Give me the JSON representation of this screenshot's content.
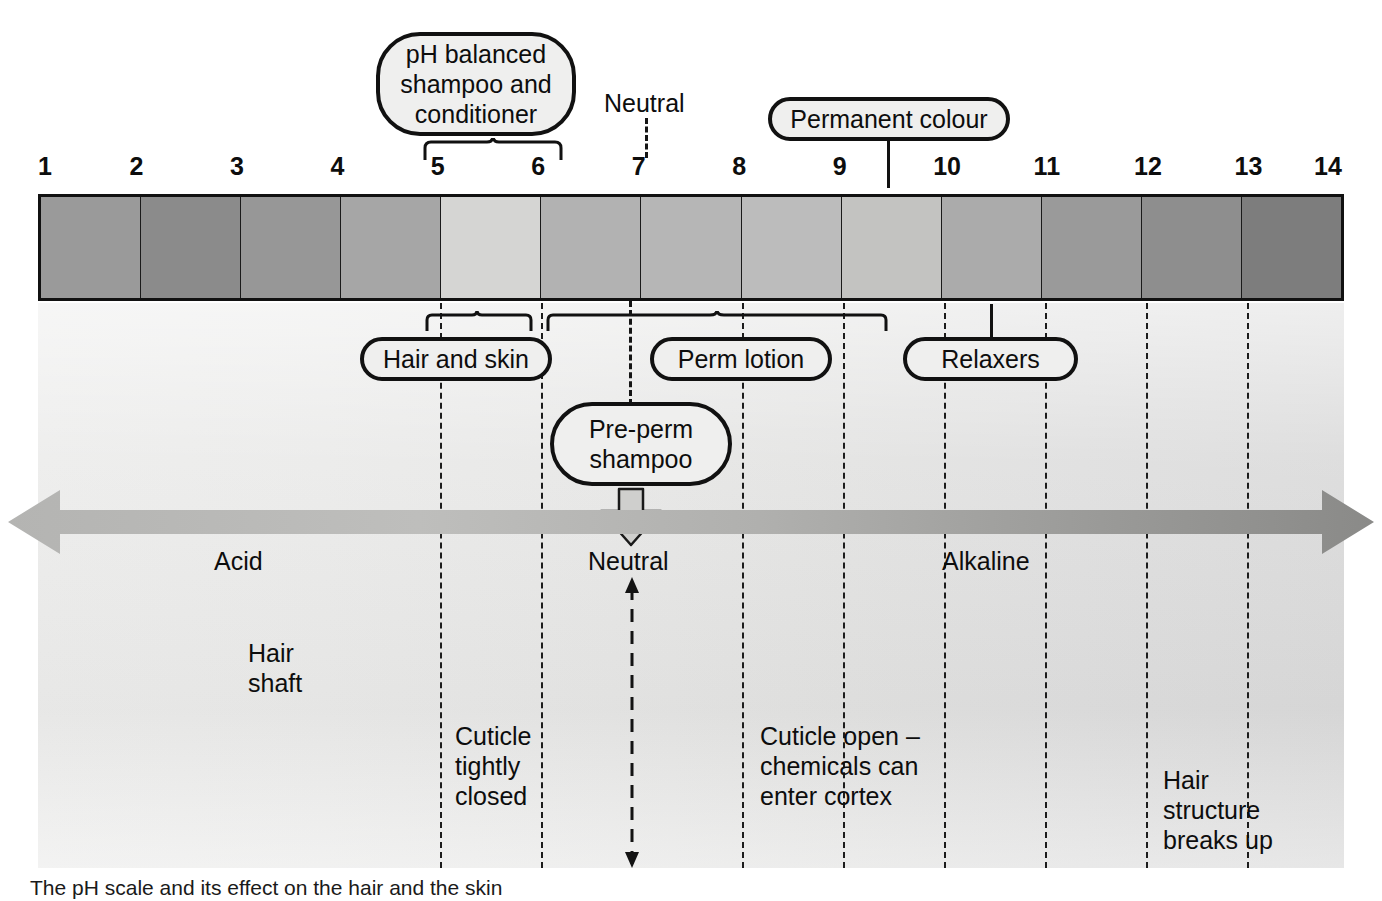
{
  "diagram": {
    "scale": {
      "ticks": [
        "1",
        "2",
        "3",
        "4",
        "5",
        "6",
        "7",
        "8",
        "9",
        "10",
        "11",
        "12",
        "13",
        "14"
      ],
      "bands": [
        {
          "ph": "1-2",
          "color": "#9a9a9a"
        },
        {
          "ph": "2-3",
          "color": "#8b8b8b"
        },
        {
          "ph": "3-4",
          "color": "#979797"
        },
        {
          "ph": "4-5",
          "color": "#a6a6a6"
        },
        {
          "ph": "5-6",
          "color": "#d5d5d3"
        },
        {
          "ph": "6-7",
          "color": "#b2b2b2"
        },
        {
          "ph": "7-8",
          "color": "#b6b6b6"
        },
        {
          "ph": "8-9",
          "color": "#bcbcbc"
        },
        {
          "ph": "9-10",
          "color": "#c3c3c1"
        },
        {
          "ph": "10-11",
          "color": "#ababab"
        },
        {
          "ph": "11-12",
          "color": "#9a9a9a"
        },
        {
          "ph": "12-13",
          "color": "#8e8e8e"
        },
        {
          "ph": "13-14",
          "color": "#7d7d7d"
        }
      ],
      "left_label": "Acid",
      "right_label": "Alkaline",
      "neutral_label": "Neutral"
    },
    "callouts_top": [
      {
        "id": "ph-balanced",
        "label": "pH balanced\nshampoo and\nconditioner",
        "range": "5-6"
      },
      {
        "id": "permanent-colour",
        "label": "Permanent colour",
        "range": "9.5"
      }
    ],
    "callouts_mid": [
      {
        "id": "hair-and-skin",
        "label": "Hair and skin",
        "range": "4.5-5.5"
      },
      {
        "id": "perm-lotion",
        "label": "Perm lotion",
        "range": "6-9"
      },
      {
        "id": "relaxers",
        "label": "Relaxers",
        "range": "10"
      }
    ],
    "callouts_low": [
      {
        "id": "pre-perm-shampoo",
        "label": "Pre-perm\nshampoo",
        "range": "7"
      }
    ],
    "axis_lower": {
      "acid": "Acid",
      "neutral": "Neutral",
      "alkaline": "Alkaline"
    },
    "hair": {
      "shaft_label": "Hair\nshaft",
      "zones": [
        {
          "id": "cuticle-closed",
          "label": "Cuticle\ntightly\nclosed"
        },
        {
          "id": "cuticle-open",
          "label": "Cuticle open –\nchemicals can\nenter cortex"
        },
        {
          "id": "structure-breaks",
          "label": "Hair\nstructure\nbreaks up"
        }
      ]
    },
    "caption": "The pH scale and its effect on the hair and the skin"
  },
  "chart_data": {
    "type": "bar",
    "xlabel": "pH",
    "ylabel": "",
    "categories": [
      "1",
      "2",
      "3",
      "4",
      "5",
      "6",
      "7",
      "8",
      "9",
      "10",
      "11",
      "12",
      "13",
      "14"
    ],
    "x": [
      1,
      2,
      3,
      4,
      5,
      6,
      7,
      8,
      9,
      10,
      11,
      12,
      13,
      14
    ],
    "xlim": [
      1,
      14
    ],
    "grid": false,
    "legend": "none",
    "values": [
      61,
      55,
      59,
      65,
      84,
      70,
      71,
      74,
      77,
      67,
      61,
      56,
      49,
      49
    ],
    "annotations": [
      {
        "text": "pH balanced shampoo and conditioner",
        "x_start": 4.6,
        "x_end": 6.0
      },
      {
        "text": "Hair and skin",
        "x_start": 4.55,
        "x_end": 5.65
      },
      {
        "text": "Perm lotion",
        "x_start": 6.0,
        "x_end": 9.3
      },
      {
        "text": "Permanent colour",
        "x": 9.5
      },
      {
        "text": "Relaxers",
        "x": 10.05
      },
      {
        "text": "Pre-perm shampoo",
        "x": 7.0
      },
      {
        "text": "Neutral",
        "x": 7.0
      },
      {
        "text": "Acid",
        "x": 1.0
      },
      {
        "text": "Alkaline",
        "x": 14.0
      },
      {
        "text": "Cuticle tightly closed",
        "x_start": 4.3,
        "x_end": 5.5
      },
      {
        "text": "Cuticle open – chemicals can enter cortex",
        "x_start": 8.0,
        "x_end": 9.8
      },
      {
        "text": "Hair structure breaks up",
        "x_start": 12.0,
        "x_end": 13.0
      }
    ]
  }
}
